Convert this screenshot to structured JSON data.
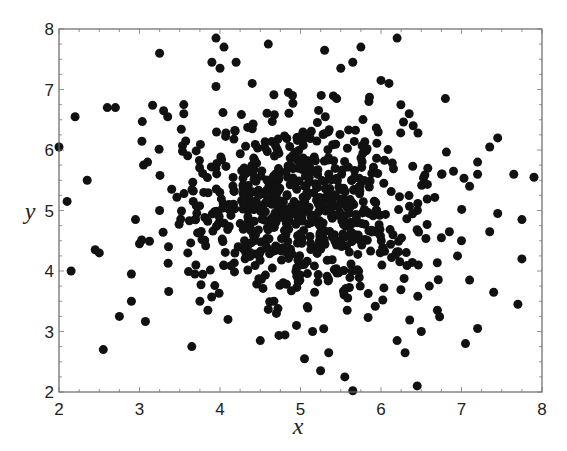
{
  "chart_data": {
    "type": "scatter",
    "title": "",
    "xlabel": "x",
    "ylabel": "y",
    "xlim": [
      2,
      8
    ],
    "ylim": [
      2,
      8
    ],
    "xticks": [
      "2",
      "3",
      "4",
      "5",
      "6",
      "7",
      "8"
    ],
    "yticks": [
      "2",
      "3",
      "4",
      "5",
      "6",
      "7",
      "8"
    ],
    "grid": false,
    "legend": null,
    "marker_color": "#111111",
    "marker_radius_px": 4.5,
    "frame_color": "#666666",
    "approx_point_count": 800,
    "distribution": {
      "kind": "bivariate normal, approx",
      "center": [
        5.0,
        5.0
      ],
      "std": [
        0.95,
        0.95
      ]
    },
    "outlier_points": [
      [
        2.0,
        6.05
      ],
      [
        2.2,
        6.55
      ],
      [
        2.1,
        5.15
      ],
      [
        2.15,
        4.0
      ],
      [
        2.55,
        2.7
      ],
      [
        2.6,
        6.7
      ],
      [
        2.7,
        6.7
      ],
      [
        2.35,
        5.5
      ],
      [
        2.5,
        4.3
      ],
      [
        2.45,
        4.35
      ],
      [
        2.75,
        3.25
      ],
      [
        2.9,
        3.5
      ],
      [
        2.9,
        3.95
      ],
      [
        3.0,
        4.45
      ],
      [
        2.95,
        4.85
      ],
      [
        3.25,
        7.6
      ],
      [
        3.3,
        6.65
      ],
      [
        3.35,
        6.55
      ],
      [
        3.55,
        6.75
      ],
      [
        3.55,
        6.6
      ],
      [
        3.1,
        5.8
      ],
      [
        3.05,
        5.75
      ],
      [
        3.4,
        5.35
      ],
      [
        3.25,
        5.0
      ],
      [
        3.6,
        4.3
      ],
      [
        3.65,
        2.75
      ],
      [
        3.7,
        4.1
      ],
      [
        3.75,
        3.5
      ],
      [
        3.85,
        3.35
      ],
      [
        4.5,
        2.85
      ],
      [
        3.95,
        7.85
      ],
      [
        4.05,
        7.7
      ],
      [
        3.9,
        7.45
      ],
      [
        3.95,
        7.05
      ],
      [
        4.0,
        7.35
      ],
      [
        4.6,
        7.75
      ],
      [
        4.2,
        7.45
      ],
      [
        4.4,
        7.1
      ],
      [
        4.85,
        6.95
      ],
      [
        4.9,
        6.9
      ],
      [
        5.3,
        7.65
      ],
      [
        5.75,
        7.7
      ],
      [
        5.5,
        7.35
      ],
      [
        6.2,
        7.85
      ],
      [
        6.0,
        7.15
      ],
      [
        5.65,
        7.45
      ],
      [
        5.45,
        6.85
      ],
      [
        5.85,
        6.8
      ],
      [
        6.1,
        7.1
      ],
      [
        6.35,
        6.6
      ],
      [
        6.8,
        6.85
      ],
      [
        6.4,
        6.4
      ],
      [
        7.45,
        6.2
      ],
      [
        7.35,
        6.05
      ],
      [
        7.2,
        5.8
      ],
      [
        6.9,
        5.65
      ],
      [
        7.2,
        5.6
      ],
      [
        7.1,
        5.4
      ],
      [
        7.45,
        4.95
      ],
      [
        7.9,
        5.55
      ],
      [
        7.65,
        5.6
      ],
      [
        7.75,
        4.85
      ],
      [
        7.75,
        4.2
      ],
      [
        7.35,
        4.65
      ],
      [
        7.0,
        4.5
      ],
      [
        7.1,
        3.85
      ],
      [
        7.7,
        3.45
      ],
      [
        7.2,
        3.05
      ],
      [
        7.05,
        2.8
      ],
      [
        7.4,
        3.65
      ],
      [
        6.2,
        2.85
      ],
      [
        6.5,
        3.0
      ],
      [
        6.3,
        2.65
      ],
      [
        6.45,
        2.1
      ],
      [
        5.55,
        2.25
      ],
      [
        5.65,
        2.02
      ],
      [
        5.05,
        2.55
      ],
      [
        5.25,
        2.35
      ],
      [
        5.35,
        2.65
      ],
      [
        4.95,
        3.1
      ],
      [
        5.15,
        3.0
      ],
      [
        4.7,
        3.3
      ],
      [
        4.1,
        3.2
      ],
      [
        6.7,
        3.35
      ],
      [
        6.6,
        3.75
      ],
      [
        6.95,
        4.25
      ],
      [
        6.85,
        4.65
      ],
      [
        6.75,
        4.55
      ]
    ],
    "cluster_points_seed": 1337,
    "cluster_points_count": 710
  }
}
